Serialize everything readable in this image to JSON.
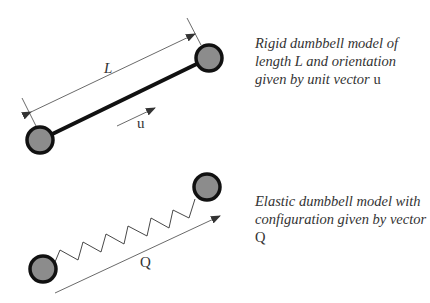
{
  "figure": {
    "rigid": {
      "length_label": "L",
      "direction_label": "u",
      "caption": {
        "text": "Rigid dumbbell model of length L and orientation given by unit vector",
        "symbol": "u"
      }
    },
    "elastic": {
      "vector_label": "Q",
      "caption": {
        "text": "Elastic dumbbell model with configuration given by vector",
        "symbol": "Q"
      }
    },
    "colors": {
      "bead_fill": "#8c8c8c",
      "bead_stroke": "#111111",
      "rod": "#111111",
      "thin_line": "#444444",
      "text": "#333333"
    }
  }
}
